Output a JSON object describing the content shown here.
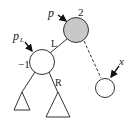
{
  "diagram": {
    "type": "tree-rotation",
    "nodes": {
      "p": {
        "label": "p",
        "balance": "2",
        "fill": "#c8c8c8"
      },
      "pL": {
        "label": "p",
        "subscript": "L",
        "balance": "−1",
        "fill": "#ffffff"
      },
      "x": {
        "label": "x",
        "fill": "#ffffff"
      }
    },
    "edges": {
      "left_label": "L",
      "right_label": "R"
    },
    "colors": {
      "stroke": "#333333",
      "gray_node": "#c8c8c8"
    }
  }
}
